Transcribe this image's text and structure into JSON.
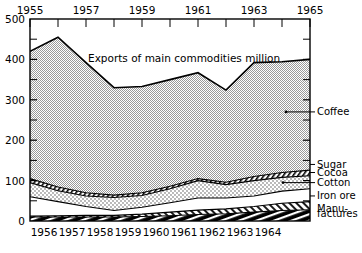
{
  "chart_data": {
    "type": "area",
    "stacked": true,
    "title": "Exports of main commodities million",
    "xlabel": "",
    "ylabel": "",
    "xlim": [
      1955,
      1965
    ],
    "ylim": [
      0,
      500
    ],
    "grid": false,
    "legend_position": "right-inline",
    "y_ticks_major": [
      0,
      100,
      200,
      300,
      400,
      500
    ],
    "y_ticks_minor": [
      50,
      150,
      250,
      350,
      450
    ],
    "x_ticks_top": [
      1955,
      1956,
      1957,
      1958,
      1959,
      1960,
      1961,
      1962,
      1963,
      1964,
      1965
    ],
    "x_ticklabels_top": [
      "1955",
      "",
      "1957",
      "",
      "1959",
      "",
      "1961",
      "",
      "1963",
      "",
      "1965"
    ],
    "x_ticklabels_bottom": [
      "1956",
      "1957",
      "1958",
      "1959",
      "1960",
      "1961",
      "1962",
      "1963",
      "1964"
    ],
    "x": [
      1955,
      1956,
      1957,
      1958,
      1959,
      1960,
      1961,
      1962,
      1963,
      1964,
      1965
    ],
    "series": [
      {
        "name": "Manufactures",
        "values": [
          10,
          10,
          10,
          10,
          11,
          13,
          16,
          18,
          22,
          26,
          28
        ]
      },
      {
        "name": "Iron ore",
        "values": [
          12,
          13,
          14,
          14,
          17,
          22,
          27,
          30,
          36,
          44,
          48
        ]
      },
      {
        "name": "Cotton",
        "values": [
          60,
          48,
          36,
          26,
          34,
          45,
          57,
          57,
          62,
          74,
          80
        ]
      },
      {
        "name": "Cocoa",
        "values": [
          95,
          75,
          62,
          58,
          63,
          80,
          100,
          90,
          100,
          108,
          112
        ]
      },
      {
        "name": "Sugar",
        "values": [
          105,
          84,
          70,
          64,
          70,
          86,
          105,
          96,
          110,
          120,
          126
        ]
      },
      {
        "name": "Coffee",
        "values": [
          420,
          455,
          392,
          330,
          333,
          350,
          367,
          324,
          392,
          394,
          400
        ]
      }
    ],
    "legend": [
      {
        "label": "Coffee",
        "y_value": 270
      },
      {
        "label": "Sugar",
        "y_value": 140
      },
      {
        "label": "Cocoa",
        "y_value": 120
      },
      {
        "label": "Cotton",
        "y_value": 95
      },
      {
        "label": "Iron ore",
        "y_value": 62
      },
      {
        "label": "Manu-",
        "y_value": 32
      },
      {
        "label": "factures",
        "y_value": 18
      }
    ]
  },
  "colors": {
    "axis": "#000000",
    "coffee_fill": "#e2e2e2",
    "sugar_fill": "#ffffff",
    "cocoa_fill": "#e8e8e8",
    "cotton_fill": "#ffffff",
    "ironore_fill": "#ffffff",
    "manufactures_fill": "#000000",
    "background": "#ffffff"
  }
}
